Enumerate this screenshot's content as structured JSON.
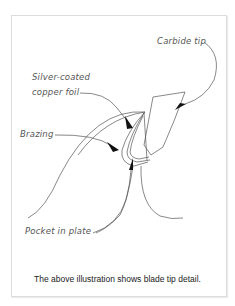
{
  "figure": {
    "labels": {
      "carbide_tip": "Carbide tip",
      "silver_foil_line1": "Silver-coated",
      "silver_foil_line2": "copper foil",
      "brazing": "Brazing",
      "pocket": "Pocket in plate"
    },
    "caption": "The above illustration shows blade tip detail.",
    "colors": {
      "line": "#555555",
      "arrow": "#111111",
      "border": "#dcdcdc"
    }
  }
}
